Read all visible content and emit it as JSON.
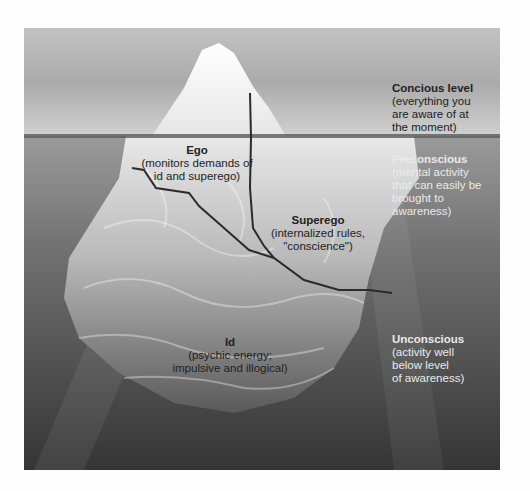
{
  "diagram": {
    "type": "iceberg-model-of-mind",
    "levels": [
      {
        "title": "Concious level",
        "desc": [
          "(everything you",
          "are aware of at",
          "the moment)"
        ]
      },
      {
        "title": "Preconscious",
        "desc": [
          "(mental activity",
          "that can easily be",
          "brought to",
          "awareness)"
        ]
      },
      {
        "title": "Unconscious",
        "desc": [
          "(activity well",
          "below level",
          "of awareness)"
        ]
      }
    ],
    "structures": [
      {
        "title": "Ego",
        "desc": [
          "(monitors demands of",
          "id and superego)"
        ]
      },
      {
        "title": "Superego",
        "desc": [
          "(internalized rules,",
          "\"conscience\")"
        ]
      },
      {
        "title": "Id",
        "desc": [
          "(psychic energy;",
          "impulsive and illogical)"
        ]
      }
    ]
  },
  "colors": {
    "sky_top": "#b9b9b9",
    "sky_bottom": "#d4d4d4",
    "water_top": "#8c8c8c",
    "water_bottom": "#3a3a3a",
    "ice_top": "#f4f4f4",
    "ice_under": "#bdbdbd",
    "ice_deep": "#6e6e6e",
    "divider": "#2b2b2b"
  }
}
